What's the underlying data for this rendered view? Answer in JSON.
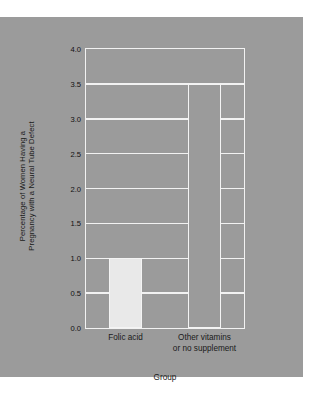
{
  "chart_data": {
    "type": "bar",
    "title": "",
    "subtitle": "",
    "xlabel": "Group",
    "ylabel_line1": "Percentage of Women Having a",
    "ylabel_line2": "Pregnancy with a Neural Tube Defect",
    "categories": [
      "Folic acid",
      "Other vitamins or no supplement"
    ],
    "category_labels": [
      {
        "line1": "Folic acid",
        "line2": ""
      },
      {
        "line1": "Other vitamins",
        "line2": "or no supplement"
      }
    ],
    "values": [
      1.0,
      3.5
    ],
    "ylim": [
      0.0,
      4.0
    ],
    "ytick_labels": [
      "0.0",
      "0.5",
      "1.0",
      "1.5",
      "2.0",
      "2.5",
      "3.0",
      "3.5",
      "4.0"
    ],
    "ytick_values": [
      0.0,
      0.5,
      1.0,
      1.5,
      2.0,
      2.5,
      3.0,
      3.5,
      4.0
    ],
    "grid": true,
    "grid_axis": "y",
    "legend": false,
    "legend_position": "none",
    "bar_colors": [
      "#e9e9e9",
      "#9b9b9b"
    ],
    "bar_edge_color": "#f4f4f4",
    "plot_background": "#9b9b9b",
    "figure_background": "#9b9b9b",
    "page_background": "#ffffff",
    "grid_color": "#f2f2f2",
    "text_color": "#1a1a1a"
  }
}
